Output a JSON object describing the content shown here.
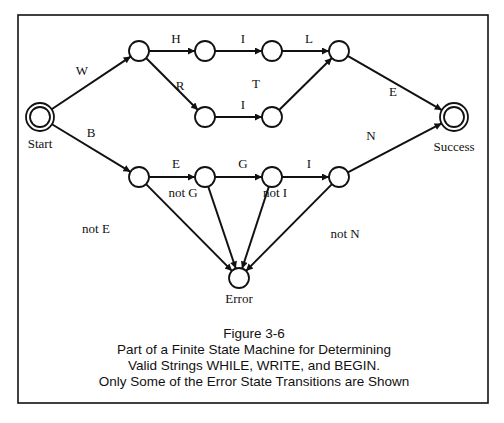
{
  "figure": {
    "title": "Figure 3-6",
    "caption_lines": [
      "Part of a Finite State Machine for Determining",
      "Valid Strings WHILE, WRITE, and BEGIN.",
      "Only Some of the Error State Transitions are Shown"
    ]
  },
  "states": [
    {
      "id": "start",
      "label": "Start",
      "kind": "accept-double"
    },
    {
      "id": "w",
      "label": "",
      "kind": "normal"
    },
    {
      "id": "wh",
      "label": "",
      "kind": "normal"
    },
    {
      "id": "whi",
      "label": "",
      "kind": "normal"
    },
    {
      "id": "whil",
      "label": "",
      "kind": "normal"
    },
    {
      "id": "wr",
      "label": "",
      "kind": "normal"
    },
    {
      "id": "wri",
      "label": "",
      "kind": "normal"
    },
    {
      "id": "success",
      "label": "Success",
      "kind": "accept-double"
    },
    {
      "id": "b",
      "label": "",
      "kind": "normal"
    },
    {
      "id": "be",
      "label": "",
      "kind": "normal"
    },
    {
      "id": "beg",
      "label": "",
      "kind": "normal"
    },
    {
      "id": "begi",
      "label": "",
      "kind": "normal"
    },
    {
      "id": "error",
      "label": "Error",
      "kind": "normal"
    }
  ],
  "transitions": [
    {
      "from": "start",
      "to": "w",
      "label": "W"
    },
    {
      "from": "w",
      "to": "wh",
      "label": "H"
    },
    {
      "from": "wh",
      "to": "whi",
      "label": "I"
    },
    {
      "from": "whi",
      "to": "whil",
      "label": "L"
    },
    {
      "from": "w",
      "to": "wr",
      "label": "R"
    },
    {
      "from": "wr",
      "to": "wri",
      "label": "I"
    },
    {
      "from": "wri",
      "to": "whil",
      "label": "T"
    },
    {
      "from": "whil",
      "to": "success",
      "label": "E"
    },
    {
      "from": "start",
      "to": "b",
      "label": "B"
    },
    {
      "from": "b",
      "to": "be",
      "label": "E"
    },
    {
      "from": "be",
      "to": "beg",
      "label": "G"
    },
    {
      "from": "beg",
      "to": "begi",
      "label": "I"
    },
    {
      "from": "begi",
      "to": "success",
      "label": "N"
    },
    {
      "from": "b",
      "to": "error",
      "label": "not E"
    },
    {
      "from": "be",
      "to": "error",
      "label": "not G"
    },
    {
      "from": "beg",
      "to": "error",
      "label": "not I"
    },
    {
      "from": "begi",
      "to": "error",
      "label": "not N"
    }
  ]
}
